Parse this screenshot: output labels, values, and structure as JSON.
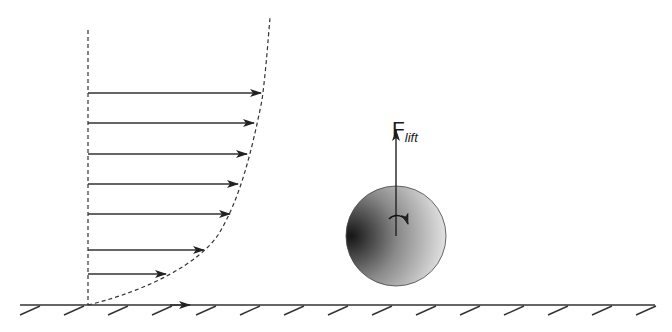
{
  "diagram": {
    "lift_label": {
      "main": "F",
      "subscript": "lift"
    },
    "colors": {
      "line": "#333333",
      "sphere_dark": "#1c1c1c",
      "sphere_light": "#f2f2f2",
      "background": "#ffffff"
    },
    "velocity_profile": {
      "axis_x": 88,
      "wall_y": 305,
      "arrows": [
        {
          "y": 93,
          "tip_x": 261
        },
        {
          "y": 123,
          "tip_x": 254
        },
        {
          "y": 154,
          "tip_x": 247
        },
        {
          "y": 184,
          "tip_x": 238
        },
        {
          "y": 214,
          "tip_x": 230
        },
        {
          "y": 250,
          "tip_x": 204
        },
        {
          "y": 274,
          "tip_x": 166
        }
      ]
    },
    "wall": {
      "x_start": 20,
      "x_end": 655,
      "hatch_spacing": 44,
      "wall_arrow_x": 190
    },
    "sphere": {
      "cx": 396,
      "cy": 236,
      "r": 50,
      "rotation": "clockwise"
    },
    "lift_arrow": {
      "x": 396,
      "y_from": 236,
      "y_to": 128
    }
  }
}
